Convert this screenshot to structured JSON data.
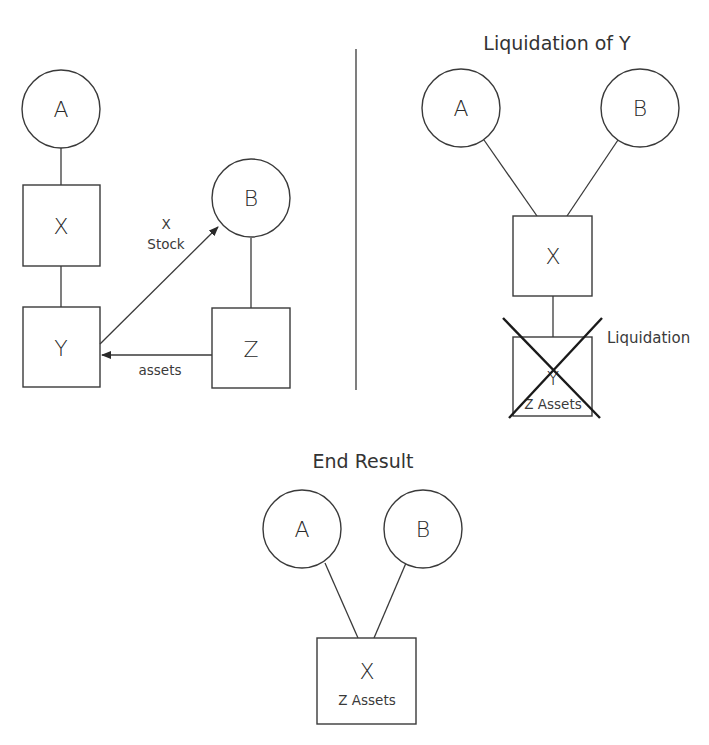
{
  "diagram": {
    "panels": {
      "before": {
        "title": "",
        "nodes": {
          "A": {
            "label": "A",
            "shape": "circle"
          },
          "X": {
            "label": "X",
            "shape": "box"
          },
          "Y": {
            "label": "Y",
            "shape": "box"
          },
          "B": {
            "label": "B",
            "shape": "circle"
          },
          "Z": {
            "label": "Z",
            "shape": "box"
          }
        },
        "edges": {
          "x_stock_label_line1": "X",
          "x_stock_label_line2": "Stock",
          "assets_label": "assets"
        }
      },
      "liquidation": {
        "title": "Liquidation of Y",
        "nodes": {
          "A": {
            "label": "A",
            "shape": "circle"
          },
          "B": {
            "label": "B",
            "shape": "circle"
          },
          "X": {
            "label": "X",
            "shape": "box"
          },
          "Y": {
            "label": "Y",
            "sublabel": "Z Assets",
            "shape": "box",
            "crossed_out": true
          }
        },
        "annotation": "Liquidation"
      },
      "end_result": {
        "title": "End Result",
        "nodes": {
          "A": {
            "label": "A",
            "shape": "circle"
          },
          "B": {
            "label": "B",
            "shape": "circle"
          },
          "X": {
            "label": "X",
            "sublabel": "Z Assets",
            "shape": "box"
          }
        }
      }
    },
    "colors": {
      "stroke": "#3a3a3a",
      "text": "#2a2a2a",
      "background": "#ffffff"
    }
  }
}
